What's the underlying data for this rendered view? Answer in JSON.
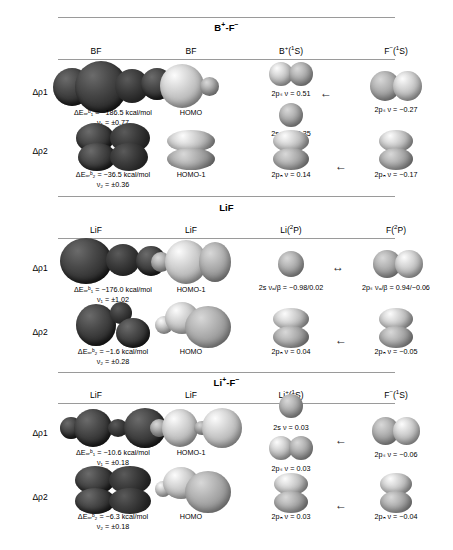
{
  "figure": {
    "sections": [
      {
        "id": "bf",
        "title": "B+-F-",
        "title_html": "B⁺-F⁻",
        "columns": [
          "BF",
          "BF",
          "B⁺(¹S)",
          "F⁻(¹S)"
        ],
        "rows": [
          {
            "label": "Δρ1",
            "energy": "ΔEₒᵣᵇ₁ = −186.5 kcal/mol",
            "nu": "ν₁ = ±0.77",
            "mo_label": "HOMO",
            "arrow": "←",
            "frag_left": [
              "2pₛ ν = 0.51",
              "2s ν = −0.35"
            ],
            "frag_right": [
              "2pₛ ν = −0.27"
            ]
          },
          {
            "label": "Δρ2",
            "energy": "ΔEₒᵣᵇ₂ = −36.5 kcal/mol",
            "nu": "ν₂ = ±0.36",
            "mo_label": "HOMO-1",
            "arrow": "←",
            "frag_left": [
              "2pₙ ν = 0.14"
            ],
            "frag_right": [
              "2pₙ ν = −0.17"
            ]
          }
        ]
      },
      {
        "id": "lif_neutral",
        "title": "LiF",
        "title_html": "LiF",
        "columns": [
          "LiF",
          "LiF",
          "Li(²P)",
          "F(²P)"
        ],
        "rows": [
          {
            "label": "Δρ1",
            "energy": "ΔEₒᵣᵇ₁ = −176.0 kcal/mol",
            "nu": "ν₁ = ±1.02",
            "mo_label": "HOMO-1",
            "arrow": "↔",
            "frag_left": [
              "2s νₐ/β = −0.98/0.02"
            ],
            "frag_right": [
              "2pₛ νₐ/β = 0.94/−0.06"
            ]
          },
          {
            "label": "Δρ2",
            "energy": "ΔEₒᵣᵇ₂ = −1.6 kcal/mol",
            "nu": "ν₂ = ±0.28",
            "mo_label": "HOMO",
            "arrow": "←",
            "frag_left": [
              "2pₙ ν = 0.04"
            ],
            "frag_right": [
              "2pₙ ν = −0.05"
            ]
          }
        ]
      },
      {
        "id": "li_f_ionic",
        "title": "Li+-F-",
        "title_html": "Li⁺-F⁻",
        "columns": [
          "LiF",
          "LiF",
          "Li⁺(¹S)",
          "F⁻(¹S)"
        ],
        "rows": [
          {
            "label": "Δρ1",
            "energy": "ΔEₒᵣᵇ₁ = −10.6 kcal/mol",
            "nu": "ν₁ = ±0.18",
            "mo_label": "HOMO-1",
            "arrow": "←",
            "frag_left": [
              "2s ν = 0.03",
              "2pₛ ν = 0.03"
            ],
            "frag_right": [
              "2pₛ ν = −0.06"
            ]
          },
          {
            "label": "Δρ2",
            "energy": "ΔEₒᵣᵇ₂ = −6.3 kcal/mol",
            "nu": "ν₂ = ±0.18",
            "mo_label": "HOMO",
            "arrow": "←",
            "frag_left": [
              "2pₙ ν = 0.03"
            ],
            "frag_right": [
              "2pₙ ν = −0.04"
            ]
          }
        ]
      }
    ]
  }
}
